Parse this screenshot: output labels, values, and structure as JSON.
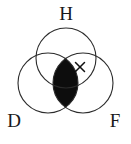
{
  "figure": {
    "type": "venn-diagram",
    "background_color": "#ffffff",
    "stroke_color": "#2b2b2b",
    "shade_color": "#0d0d0d",
    "set_count": 3
  },
  "labels": {
    "top": "H",
    "bottom_left": "D",
    "bottom_right": "F"
  },
  "sets": [
    {
      "id": "H",
      "label": "H",
      "label_position": "top",
      "cx": 66,
      "cy": 58,
      "r": 30,
      "label_x": 66,
      "label_y": 20
    },
    {
      "id": "D",
      "label": "D",
      "label_position": "bottom-left",
      "cx": 48,
      "cy": 83,
      "r": 30,
      "label_x": 14,
      "label_y": 127
    },
    {
      "id": "F",
      "label": "F",
      "label_position": "bottom-right",
      "cx": 83,
      "cy": 83,
      "r": 30,
      "label_x": 115,
      "label_y": 127
    }
  ],
  "shaded_region": {
    "name": "D-intersect-F",
    "description": "lens-shaped intersection of D and F, filled solid black",
    "fill": "#0d0d0d"
  },
  "marks": [
    {
      "symbol": "x",
      "name": "x-mark",
      "region": "H-intersect-F",
      "x": 80,
      "y": 67,
      "size": 5
    }
  ]
}
